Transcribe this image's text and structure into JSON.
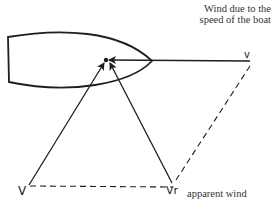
{
  "diagram": {
    "captions": {
      "boat_speed_wind_line1": "Wind due to the",
      "boat_speed_wind_line2": "speed of the boat",
      "apparent_wind": "apparent wind"
    },
    "labels": {
      "true_wind": "V",
      "apparent_wind_vector": "Vr",
      "boat_wind_vector": "v"
    },
    "colors": {
      "stroke": "#1e1e1e",
      "background": "#ffffff"
    }
  }
}
